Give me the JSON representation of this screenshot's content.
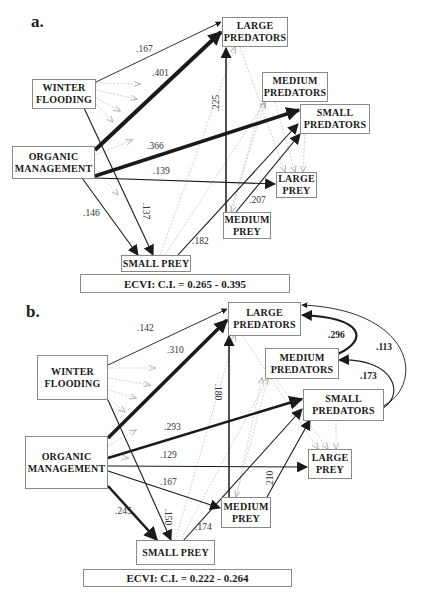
{
  "panels": [
    {
      "label": "a.",
      "nodes": {
        "large_predators": [
          "LARGE",
          "PREDATORS"
        ],
        "winter_flooding": [
          "WINTER",
          "FLOODING"
        ],
        "medium_predators": [
          "MEDIUM",
          "PREDATORS"
        ],
        "small_predators": [
          "SMALL",
          "PREDATORS"
        ],
        "organic_management": [
          "ORGANIC",
          "MANAGEMENT"
        ],
        "large_prey": [
          "LARGE",
          "PREY"
        ],
        "medium_prey": [
          "MEDIUM",
          "PREY"
        ],
        "small_prey": [
          "SMALL PREY"
        ]
      },
      "fit": "ECVI: C.I. = 0.265 - 0.395",
      "paths": [
        {
          "from": "winter_flooding",
          "to": "large_predators",
          "coef": ".167"
        },
        {
          "from": "organic_management",
          "to": "large_predators",
          "coef": ".401"
        },
        {
          "from": "organic_management",
          "to": "small_predators",
          "coef": ".366"
        },
        {
          "from": "organic_management",
          "to": "large_prey",
          "coef": ".139"
        },
        {
          "from": "organic_management",
          "to": "small_prey",
          "coef": ".146"
        },
        {
          "from": "winter_flooding",
          "to": "small_prey",
          "coef": ".137"
        },
        {
          "from": "medium_prey",
          "to": "large_predators",
          "coef": ".225"
        },
        {
          "from": "medium_prey",
          "to": "small_predators",
          "coef": ".207"
        },
        {
          "from": "small_prey",
          "to": "small_predators",
          "coef": ".182"
        }
      ]
    },
    {
      "label": "b.",
      "nodes": {
        "large_predators": [
          "LARGE",
          "PREDATORS"
        ],
        "winter_flooding": [
          "WINTER",
          "FLOODING"
        ],
        "medium_predators": [
          "MEDIUM",
          "PREDATORS"
        ],
        "small_predators": [
          "SMALL",
          "PREDATORS"
        ],
        "organic_management": [
          "ORGANIC",
          "MANAGEMENT"
        ],
        "large_prey": [
          "LARGE",
          "PREY"
        ],
        "medium_prey": [
          "MEDIUM",
          "PREY"
        ],
        "small_prey": [
          "SMALL PREY"
        ]
      },
      "fit": "ECVI: C.I. = 0.222 - 0.264",
      "paths": [
        {
          "from": "winter_flooding",
          "to": "large_predators",
          "coef": ".142"
        },
        {
          "from": "organic_management",
          "to": "large_predators",
          "coef": ".310"
        },
        {
          "from": "organic_management",
          "to": "small_predators",
          "coef": ".293"
        },
        {
          "from": "organic_management",
          "to": "large_prey",
          "coef": ".129"
        },
        {
          "from": "organic_management",
          "to": "medium_prey",
          "coef": ".167"
        },
        {
          "from": "organic_management",
          "to": "small_prey",
          "coef": ".245"
        },
        {
          "from": "winter_flooding",
          "to": "small_prey",
          "coef": ".150"
        },
        {
          "from": "medium_prey",
          "to": "large_predators",
          "coef": ".180"
        },
        {
          "from": "medium_prey",
          "to": "small_predators",
          "coef": ".210"
        },
        {
          "from": "small_prey",
          "to": "small_predators",
          "coef": ".174"
        },
        {
          "from": "medium_predators",
          "to": "large_predators",
          "coef": ".296"
        },
        {
          "from": "small_predators",
          "to": "medium_predators",
          "coef": ".173"
        },
        {
          "from": "small_predators",
          "to": "large_predators",
          "coef": ".113"
        }
      ]
    }
  ]
}
